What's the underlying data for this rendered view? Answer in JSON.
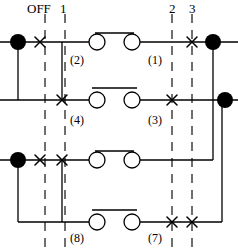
{
  "diagram": {
    "type": "electrical-contact-diagram",
    "colors": {
      "wire": "#000000",
      "node_fill": "#000000",
      "dashed_guide": "#333333",
      "text": "#000000",
      "background": "#ffffff"
    },
    "column_labels": [
      {
        "id": "off",
        "text": "OFF",
        "x": 42,
        "y": 4
      },
      {
        "id": "pos1",
        "text": "1",
        "x": 63,
        "y": 4
      },
      {
        "id": "pos2",
        "text": "2",
        "x": 172,
        "y": 4
      },
      {
        "id": "pos3",
        "text": "3",
        "x": 192,
        "y": 4
      }
    ],
    "contact_labels": [
      {
        "id": "c2",
        "text": "(2)",
        "x": 72,
        "y": 55
      },
      {
        "id": "c1",
        "text": "(1)",
        "x": 152,
        "y": 55
      },
      {
        "id": "c4",
        "text": "(4)",
        "x": 72,
        "y": 118
      },
      {
        "id": "c3",
        "text": "(3)",
        "x": 152,
        "y": 118
      },
      {
        "id": "c8",
        "text": "(8)",
        "x": 74,
        "y": 232
      },
      {
        "id": "c7",
        "text": "(7)",
        "x": 152,
        "y": 232
      }
    ],
    "guide_lines": [
      {
        "id": "guide-off",
        "x": 45,
        "y1": 14,
        "y2": 249
      },
      {
        "id": "guide-1",
        "x": 65,
        "y1": 14,
        "y2": 249
      },
      {
        "id": "guide-2",
        "x": 172,
        "y1": 14,
        "y2": 249
      },
      {
        "id": "guide-3",
        "x": 192,
        "y1": 14,
        "y2": 249
      }
    ],
    "rows": [
      {
        "id": "row-1",
        "y": 42,
        "label_left": "(2)",
        "label_right": "(1)"
      },
      {
        "id": "row-2",
        "y": 100,
        "label_left": "(4)",
        "label_right": "(3)"
      },
      {
        "id": "row-3",
        "y": 160,
        "label_left": "(8)",
        "label_right": "(7)"
      },
      {
        "id": "row-4",
        "y": 222,
        "label_left": "",
        "label_right": ""
      }
    ],
    "terminal_nodes": [
      {
        "id": "node-row1-left",
        "x": 18,
        "y": 42
      },
      {
        "id": "node-row1-right",
        "x": 212,
        "y": 42
      },
      {
        "id": "node-row2-right",
        "x": 225,
        "y": 100
      },
      {
        "id": "node-row3-left",
        "x": 18,
        "y": 160
      }
    ],
    "cross_marks": [
      {
        "id": "x-row1-off",
        "x": 40,
        "y": 42
      },
      {
        "id": "x-row1-pos2",
        "x": 192,
        "y": 42
      },
      {
        "id": "x-row2-pos1",
        "x": 62,
        "y": 100
      },
      {
        "id": "x-row2-pos2",
        "x": 172,
        "y": 100
      },
      {
        "id": "x-row3-off",
        "x": 40,
        "y": 160
      },
      {
        "id": "x-row3-pos1",
        "x": 62,
        "y": 160
      },
      {
        "id": "x-row4-pos2",
        "x": 172,
        "y": 222
      },
      {
        "id": "x-row4-pos3",
        "x": 192,
        "y": 222
      }
    ],
    "contact_pairs": [
      {
        "id": "contact-pair-row1",
        "x1": 97,
        "x2": 132,
        "y": 42,
        "bridged": true
      },
      {
        "id": "contact-pair-row2",
        "x1": 97,
        "x2": 132,
        "y": 100,
        "bridged": false
      },
      {
        "id": "contact-pair-row3",
        "x1": 97,
        "x2": 132,
        "y": 160,
        "bridged": true
      },
      {
        "id": "contact-pair-row4",
        "x1": 97,
        "x2": 132,
        "y": 222,
        "bridged": false
      }
    ]
  }
}
